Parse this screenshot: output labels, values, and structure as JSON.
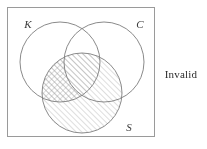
{
  "figure": {
    "kind": "three-circle-venn-diagram",
    "universe_box": {
      "x": 7,
      "y": 7,
      "width": 148,
      "height": 130,
      "stroke": "#9a9a9a",
      "stroke_width": 1,
      "fill": "#ffffff"
    },
    "circles": [
      {
        "id": "K",
        "label": "K",
        "cx": 60,
        "cy": 62,
        "r": 40,
        "stroke": "#7d7d7d"
      },
      {
        "id": "C",
        "label": "C",
        "cx": 104,
        "cy": 62,
        "r": 40,
        "stroke": "#7d7d7d"
      },
      {
        "id": "S",
        "label": "S",
        "cx": 82,
        "cy": 93,
        "r": 40,
        "stroke": "#7d7d7d"
      }
    ],
    "labels": [
      {
        "id": "K",
        "text": "K",
        "x": 28,
        "y": 26
      },
      {
        "id": "C",
        "text": "C",
        "x": 140,
        "y": 26
      },
      {
        "id": "S",
        "text": "S",
        "x": 129,
        "y": 130
      }
    ],
    "shading": {
      "hatch_color": "#8f8f8f",
      "hatch_spacing": 4,
      "hatch_stroke_width": 0.6,
      "regions": [
        {
          "id": "S-minus-C",
          "description": "S not C (includes S-and-K-not-C and S only)",
          "pattern": "single-diagonal"
        },
        {
          "id": "S-and-K-and-C",
          "description": "S and K and C center region",
          "pattern": "single-diagonal"
        },
        {
          "id": "S-and-K-not-C",
          "description": "S and K but not C",
          "pattern": "cross-hatch"
        },
        {
          "id": "S-and-C-not-K",
          "description": "S and C but not K",
          "pattern": "none"
        }
      ]
    }
  },
  "verdict": {
    "text": "Invalid",
    "x": 181,
    "y": 75,
    "color": "#2b2b2b"
  }
}
